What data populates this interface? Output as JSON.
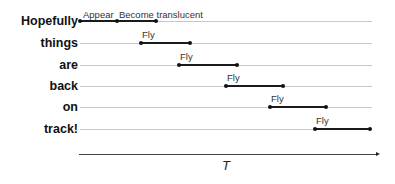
{
  "diagram": {
    "rows": [
      {
        "word": "Hopefully",
        "y": 21,
        "segments": [
          {
            "label": "Appear",
            "x1": 80,
            "x2": 117
          },
          {
            "label": "Become translucent",
            "x1": 117,
            "x2": 156
          }
        ]
      },
      {
        "word": "things",
        "y": 43,
        "segments": [
          {
            "label": "Fly",
            "x1": 141,
            "x2": 190
          }
        ]
      },
      {
        "word": "are",
        "y": 65,
        "segments": [
          {
            "label": "Fly",
            "x1": 179,
            "x2": 237
          }
        ]
      },
      {
        "word": "back",
        "y": 86,
        "segments": [
          {
            "label": "Fly",
            "x1": 226,
            "x2": 283
          }
        ]
      },
      {
        "word": "on",
        "y": 107,
        "segments": [
          {
            "label": "Fly",
            "x1": 270,
            "x2": 326
          }
        ]
      },
      {
        "word": "track!",
        "y": 129,
        "segments": [
          {
            "label": "Fly",
            "x1": 315,
            "x2": 370
          }
        ]
      }
    ],
    "axis_label": "T",
    "colors": {
      "track": "#c8c8c8",
      "segment": "#1a1a1a",
      "text": "#111111"
    }
  },
  "words": [
    "Hopefully",
    "things",
    "are",
    "back",
    "on",
    "track!"
  ],
  "labels": [
    "Appear",
    "Become translucent",
    "Fly",
    "Fly",
    "Fly",
    "Fly",
    "Fly"
  ],
  "axis": {
    "label": "T"
  }
}
